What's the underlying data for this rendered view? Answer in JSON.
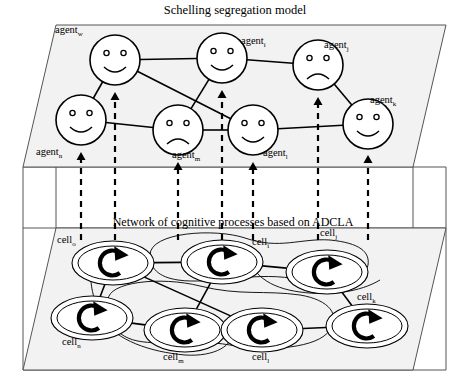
{
  "figure": {
    "title": "Schelling segregation model",
    "subtitle": "Network of cognitive processes based on ADCLA",
    "background": "#ffffff",
    "plane_fill": "#f2f2f2",
    "stroke": "#000000"
  },
  "layers": {
    "top_layer_name": "Schelling segregation model",
    "bottom_layer_name": "Network of cognitive processes based on ADCLA"
  },
  "agents": [
    {
      "id": "w",
      "label": "agent",
      "sub": "w",
      "x": 115,
      "y": 60,
      "mood": "happy",
      "label_x": 55,
      "label_y": 33
    },
    {
      "id": "i",
      "label": "agent",
      "sub": "i",
      "x": 222,
      "y": 58,
      "mood": "happy",
      "label_x": 241,
      "label_y": 44
    },
    {
      "id": "j",
      "label": "agent",
      "sub": "j",
      "x": 318,
      "y": 65,
      "mood": "sad",
      "label_x": 324,
      "label_y": 48
    },
    {
      "id": "n",
      "label": "agent",
      "sub": "n",
      "x": 81,
      "y": 120,
      "mood": "happy",
      "label_x": 36,
      "label_y": 155
    },
    {
      "id": "m",
      "label": "agent",
      "sub": "m",
      "x": 178,
      "y": 130,
      "mood": "sad",
      "label_x": 172,
      "label_y": 158
    },
    {
      "id": "l",
      "label": "agent",
      "sub": "l",
      "x": 253,
      "y": 130,
      "mood": "happy",
      "label_x": 263,
      "label_y": 156
    },
    {
      "id": "k",
      "label": "agent",
      "sub": "k",
      "x": 368,
      "y": 124,
      "mood": "happy",
      "label_x": 370,
      "label_y": 103
    }
  ],
  "agent_edges": [
    {
      "from": "w",
      "to": "i"
    },
    {
      "from": "i",
      "to": "j"
    },
    {
      "from": "j",
      "to": "k"
    },
    {
      "from": "w",
      "to": "n"
    },
    {
      "from": "w",
      "to": "l"
    },
    {
      "from": "i",
      "to": "m"
    },
    {
      "from": "n",
      "to": "m"
    },
    {
      "from": "m",
      "to": "l"
    },
    {
      "from": "l",
      "to": "k"
    }
  ],
  "cells": [
    {
      "id": "o",
      "label": "cell",
      "sub": "o",
      "x": 113,
      "y": 263,
      "label_x": 57,
      "label_y": 243
    },
    {
      "id": "i",
      "label": "cell",
      "sub": "i",
      "x": 222,
      "y": 262,
      "label_x": 252,
      "label_y": 245
    },
    {
      "id": "j",
      "label": "cell",
      "sub": "j",
      "x": 327,
      "y": 272,
      "label_x": 320,
      "label_y": 236
    },
    {
      "id": "n",
      "label": "cell",
      "sub": "n",
      "x": 92,
      "y": 318,
      "label_x": 62,
      "label_y": 345
    },
    {
      "id": "m",
      "label": "cell",
      "sub": "m",
      "x": 185,
      "y": 330,
      "label_x": 163,
      "label_y": 360
    },
    {
      "id": "l",
      "label": "cell",
      "sub": "l",
      "x": 262,
      "y": 330,
      "label_x": 252,
      "label_y": 360
    },
    {
      "id": "k",
      "label": "cell",
      "sub": "k",
      "x": 367,
      "y": 326,
      "label_x": 357,
      "label_y": 300
    }
  ],
  "cell_edges": [
    {
      "from": "o",
      "to": "i"
    },
    {
      "from": "i",
      "to": "j"
    },
    {
      "from": "o",
      "to": "n"
    },
    {
      "from": "o",
      "to": "l"
    },
    {
      "from": "i",
      "to": "m"
    },
    {
      "from": "n",
      "to": "m"
    },
    {
      "from": "m",
      "to": "l"
    },
    {
      "from": "l",
      "to": "k"
    },
    {
      "from": "j",
      "to": "k"
    }
  ],
  "projection_arrows": [
    {
      "x": 81,
      "from_y": 240,
      "to_y": 152
    },
    {
      "x": 115,
      "from_y": 240,
      "to_y": 92
    },
    {
      "x": 178,
      "from_y": 240,
      "to_y": 162
    },
    {
      "x": 222,
      "from_y": 240,
      "to_y": 90
    },
    {
      "x": 253,
      "from_y": 240,
      "to_y": 162
    },
    {
      "x": 318,
      "from_y": 240,
      "to_y": 97
    },
    {
      "x": 368,
      "from_y": 240,
      "to_y": 155
    }
  ],
  "icons": {
    "agent_happy": "smiley-happy-face-icon",
    "agent_sad": "smiley-sad-face-icon",
    "cell_process": "circular-arrow-process-icon"
  }
}
